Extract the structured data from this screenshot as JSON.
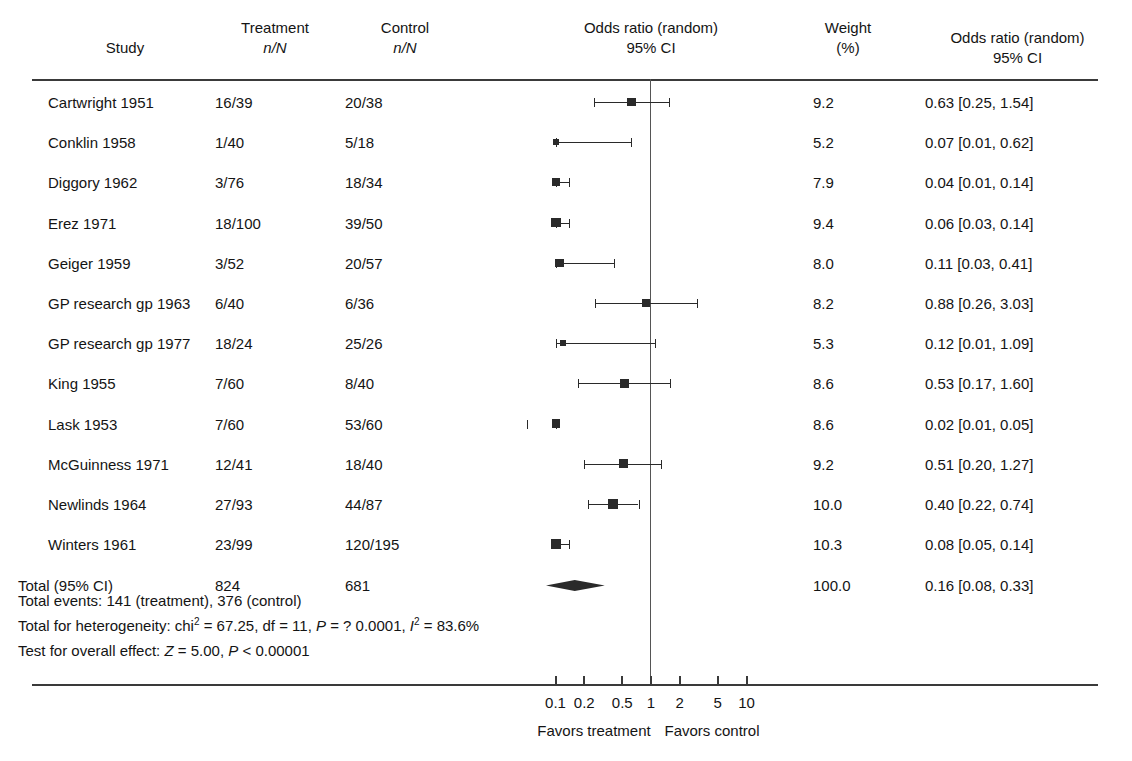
{
  "header": {
    "study": {
      "line1": "",
      "line2": "Study"
    },
    "treatment": {
      "line1": "Treatment",
      "line2": "n/N"
    },
    "control": {
      "line1": "Control",
      "line2": "n/N"
    },
    "plot": {
      "line1": "Odds ratio (random)",
      "line2": "95% CI"
    },
    "weight": {
      "line1": "Weight",
      "line2": "(%)"
    },
    "or": {
      "line1": "Odds ratio (random)",
      "line2": "95% CI"
    }
  },
  "chart_data": {
    "type": "forest",
    "title": "Odds ratio (random) 95% CI",
    "xlabel": "",
    "ylabel": "",
    "scale": "log",
    "xlim": [
      0.07,
      14
    ],
    "null_value": 1,
    "xticks": [
      0.1,
      0.2,
      0.5,
      1,
      2,
      5,
      10
    ],
    "xticklabels": [
      "0.1",
      "0.2",
      "0.5",
      "1",
      "2",
      "5",
      "10"
    ],
    "left_caption": "Favors treatment",
    "right_caption": "Favors control",
    "grid": false,
    "legend": "none",
    "columns": [
      "Study",
      "Treatment n/N",
      "Control n/N",
      "Weight (%)",
      "Odds ratio (random) 95% CI"
    ],
    "rows": [
      {
        "study": "Cartwright 1951",
        "treatment": "16/39",
        "control": "20/38",
        "weight": "9.2",
        "weight_value": 9.2,
        "or_text": "0.63 [0.25, 1.54]",
        "or": 0.63,
        "lo": 0.25,
        "hi": 1.54
      },
      {
        "study": "Conklin 1958",
        "treatment": "1/40",
        "control": "5/18",
        "weight": "5.2",
        "weight_value": 5.2,
        "or_text": "0.07 [0.01, 0.62]",
        "or": 0.07,
        "lo": 0.01,
        "hi": 0.62
      },
      {
        "study": "Diggory 1962",
        "treatment": "3/76",
        "control": "18/34",
        "weight": "7.9",
        "weight_value": 7.9,
        "or_text": "0.04 [0.01, 0.14]",
        "or": 0.04,
        "lo": 0.01,
        "hi": 0.14
      },
      {
        "study": "Erez 1971",
        "treatment": "18/100",
        "control": "39/50",
        "weight": "9.4",
        "weight_value": 9.4,
        "or_text": "0.06 [0.03, 0.14]",
        "or": 0.06,
        "lo": 0.03,
        "hi": 0.14
      },
      {
        "study": "Geiger 1959",
        "treatment": "3/52",
        "control": "20/57",
        "weight": "8.0",
        "weight_value": 8.0,
        "or_text": "0.11 [0.03, 0.41]",
        "or": 0.11,
        "lo": 0.03,
        "hi": 0.41
      },
      {
        "study": "GP research gp 1963",
        "treatment": "6/40",
        "control": "6/36",
        "weight": "8.2",
        "weight_value": 8.2,
        "or_text": "0.88 [0.26, 3.03]",
        "or": 0.88,
        "lo": 0.26,
        "hi": 3.03
      },
      {
        "study": "GP research gp 1977",
        "treatment": "18/24",
        "control": "25/26",
        "weight": "5.3",
        "weight_value": 5.3,
        "or_text": "0.12 [0.01, 1.09]",
        "or": 0.12,
        "lo": 0.01,
        "hi": 1.09
      },
      {
        "study": "King 1955",
        "treatment": "7/60",
        "control": "8/40",
        "weight": "8.6",
        "weight_value": 8.6,
        "or_text": "0.53 [0.17, 1.60]",
        "or": 0.53,
        "lo": 0.17,
        "hi": 1.6
      },
      {
        "study": "Lask 1953",
        "treatment": "7/60",
        "control": "53/60",
        "weight": "8.6",
        "weight_value": 8.6,
        "or_text": "0.02 [0.01, 0.05]",
        "or": 0.02,
        "lo": 0.01,
        "hi": 0.05
      },
      {
        "study": "McGuinness 1971",
        "treatment": "12/41",
        "control": "18/40",
        "weight": "9.2",
        "weight_value": 9.2,
        "or_text": "0.51 [0.20, 1.27]",
        "or": 0.51,
        "lo": 0.2,
        "hi": 1.27
      },
      {
        "study": "Newlinds 1964",
        "treatment": "27/93",
        "control": "44/87",
        "weight": "10.0",
        "weight_value": 10.0,
        "or_text": "0.40 [0.22, 0.74]",
        "or": 0.4,
        "lo": 0.22,
        "hi": 0.74
      },
      {
        "study": "Winters 1961",
        "treatment": "23/99",
        "control": "120/195",
        "weight": "10.3",
        "weight_value": 10.3,
        "or_text": "0.08 [0.05, 0.14]",
        "or": 0.08,
        "lo": 0.05,
        "hi": 0.14
      }
    ],
    "total": {
      "study": "Total (95% CI)",
      "treatment": "824",
      "control": "681",
      "weight": "100.0",
      "or_text": "0.16 [0.08, 0.33]",
      "or": 0.16,
      "lo": 0.08,
      "hi": 0.33
    }
  },
  "stats": {
    "total_events": "Total events: 141 (treatment), 376 (control)",
    "heterogeneity_pre": "Total for heterogeneity: chi",
    "heterogeneity_mid": " = 67.25, df = 11, ",
    "heterogeneity_p": "P",
    "heterogeneity_p_val": " = ? 0.0001, ",
    "heterogeneity_i": "I",
    "heterogeneity_i_val": " = 83.6%",
    "overall_pre": "Test for overall effect: ",
    "overall_z": "Z",
    "overall_mid": " = 5.00, ",
    "overall_p": "P",
    "overall_end": " < 0.00001"
  },
  "colors": {
    "text": "#141414",
    "rule": "#3a3a3a",
    "marker": "#2a2a2a",
    "nullline": "#555555",
    "background": "#ffffff"
  }
}
